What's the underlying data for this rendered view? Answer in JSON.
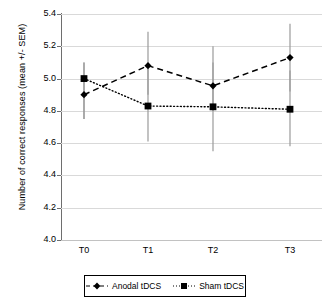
{
  "chart_data": {
    "type": "line",
    "title": "",
    "xlabel": "",
    "ylabel": "Number of correct responses (mean +/- SEM)",
    "categories": [
      "T0",
      "T1",
      "T2",
      "T3"
    ],
    "ylim": [
      4.0,
      5.4
    ],
    "yticks": [
      "4.0",
      "4.2",
      "4.4",
      "4.6",
      "4.8",
      "5.0",
      "5.2",
      "5.4"
    ],
    "ytick_values": [
      4.0,
      4.2,
      4.4,
      4.6,
      4.8,
      5.0,
      5.2,
      5.4
    ],
    "grid": true,
    "legend_position": "bottom",
    "error_type": "SEM",
    "series": [
      {
        "name": "Anodal tDCS",
        "values": [
          4.9,
          5.08,
          4.955,
          5.13
        ],
        "err_low": [
          4.75,
          4.9,
          4.8,
          4.92
        ],
        "err_high": [
          5.1,
          5.29,
          5.2,
          5.34
        ],
        "marker": "diamond",
        "linestyle": "dashed",
        "color": "#000000"
      },
      {
        "name": "Sham tDCS",
        "values": [
          5.0,
          4.83,
          4.825,
          4.81
        ],
        "err_low": [
          4.75,
          4.61,
          4.55,
          4.58
        ],
        "err_high": [
          5.1,
          5.06,
          5.1,
          5.05
        ],
        "marker": "square",
        "linestyle": "dotted",
        "color": "#000000"
      }
    ]
  },
  "legend": {
    "entries": [
      {
        "label": "Anodal tDCS",
        "marker": "diamond-marker",
        "line": "dashed"
      },
      {
        "label": "Sham tDCS",
        "marker": "square-marker",
        "line": "dotted"
      }
    ]
  },
  "colors": {
    "series_line": "#000000",
    "errorbar": "#9a9a9a",
    "gridline": "#d9d9d9",
    "axis": "#6e6e6e",
    "background": "#ffffff"
  }
}
